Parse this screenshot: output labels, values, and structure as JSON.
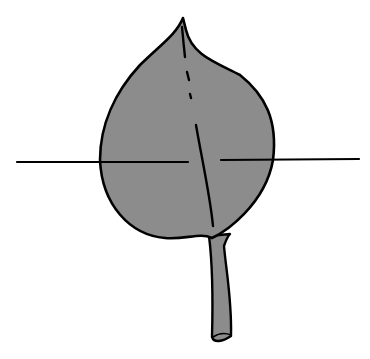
{
  "figure": {
    "colors": {
      "background": "#ffffff",
      "leaf_fill": "#8c8c8c",
      "outline": "#000000"
    },
    "elements": [
      {
        "name": "leaf-blade",
        "description": "ovate leaf blade with pointed tip"
      },
      {
        "name": "midrib",
        "description": "central vein, partly dashed"
      },
      {
        "name": "petiole",
        "description": "leaf stalk"
      },
      {
        "name": "horizontal-axis-line",
        "description": "horizontal line crossing the widest part of the leaf"
      }
    ]
  }
}
